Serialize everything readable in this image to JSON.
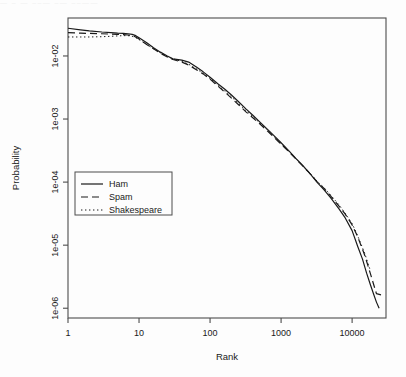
{
  "figure": {
    "background": "#fdfdfd",
    "ink": "#1a1a1a",
    "frame": "#4d4d4d",
    "artifact_text": "— –  — ––—  –— ––——"
  },
  "chart_data": {
    "type": "line",
    "title": "",
    "xlabel": "Rank",
    "ylabel": "Probability",
    "xscale": "log",
    "yscale": "log",
    "xlim": [
      1,
      30000
    ],
    "ylim": [
      7e-07,
      0.04
    ],
    "grid": false,
    "xticks": [
      1,
      10,
      100,
      1000,
      10000
    ],
    "xticklabels": [
      "1",
      "10",
      "100",
      "1000",
      "10000"
    ],
    "yticks": [
      0.01,
      0.001,
      0.0001,
      1e-05,
      1e-06
    ],
    "yticklabels": [
      "1e-02",
      "1e-03",
      "1e-04",
      "1e-05",
      "1e-06"
    ],
    "legend": {
      "position": "center-left",
      "entries": [
        {
          "name": "Ham",
          "dash": "solid"
        },
        {
          "name": "Spam",
          "dash": "dashed"
        },
        {
          "name": "Shakespeare",
          "dash": "dotted"
        }
      ]
    },
    "series": [
      {
        "name": "Ham",
        "dash": "solid",
        "x": [
          1,
          1.5,
          2,
          3,
          4,
          5,
          6,
          7,
          8,
          9,
          10,
          13,
          16,
          20,
          25,
          30,
          40,
          50,
          65,
          80,
          100,
          130,
          160,
          200,
          250,
          320,
          400,
          500,
          650,
          800,
          1000,
          1300,
          1600,
          2000,
          2500,
          3200,
          4000,
          5000,
          6500,
          8000,
          10000,
          12000,
          14000,
          16000,
          18000,
          20000,
          22000,
          24000
        ],
        "y": [
          0.0275,
          0.026,
          0.025,
          0.024,
          0.0235,
          0.023,
          0.0228,
          0.0225,
          0.022,
          0.021,
          0.0195,
          0.016,
          0.0135,
          0.0115,
          0.01,
          0.009,
          0.0086,
          0.008,
          0.0066,
          0.0056,
          0.0046,
          0.0036,
          0.003,
          0.0024,
          0.0019,
          0.00145,
          0.00115,
          0.0009,
          0.00068,
          0.00054,
          0.00042,
          0.00031,
          0.00024,
          0.000185,
          0.00014,
          0.0001,
          7.6e-05,
          5.6e-05,
          3.8e-05,
          2.7e-05,
          1.7e-05,
          9.5e-06,
          6e-06,
          3.6e-06,
          2.4e-06,
          1.7e-06,
          1.25e-06,
          1e-06
        ]
      },
      {
        "name": "Spam",
        "dash": "dashed",
        "x": [
          1,
          1.5,
          2,
          3,
          4,
          5,
          6,
          7,
          8,
          9,
          10,
          13,
          16,
          20,
          25,
          30,
          40,
          50,
          65,
          80,
          100,
          130,
          160,
          200,
          250,
          320,
          400,
          500,
          650,
          800,
          1000,
          1300,
          1600,
          2000,
          2500,
          3200,
          4000,
          5000,
          6500,
          8000,
          10000,
          12000,
          15000,
          18000,
          22000,
          27000
        ],
        "y": [
          0.0235,
          0.023,
          0.0228,
          0.0225,
          0.0222,
          0.022,
          0.0218,
          0.0215,
          0.021,
          0.02,
          0.0185,
          0.015,
          0.013,
          0.011,
          0.0096,
          0.0088,
          0.008,
          0.0072,
          0.006,
          0.0052,
          0.0043,
          0.0033,
          0.0027,
          0.00215,
          0.0017,
          0.0013,
          0.00105,
          0.00084,
          0.00064,
          0.00051,
          0.0004,
          0.0003,
          0.000235,
          0.000182,
          0.00014,
          0.000102,
          8e-05,
          6e-05,
          4.2e-05,
          3.1e-05,
          2.1e-05,
          1.35e-05,
          7e-06,
          3.6e-06,
          1.7e-06,
          1.6e-06
        ]
      },
      {
        "name": "Shakespeare",
        "dash": "dotted",
        "x": [
          1,
          1.5,
          2,
          3,
          4,
          5,
          6,
          7,
          8,
          9,
          10,
          13,
          16,
          20,
          25,
          30,
          40,
          50,
          65,
          80,
          100,
          130,
          160,
          200,
          250,
          320,
          400,
          500,
          650,
          800,
          1000,
          1300,
          1600,
          2000,
          2500,
          3200,
          4000,
          5000,
          6500,
          8000,
          10000,
          12000,
          15000,
          18000
        ],
        "y": [
          0.02,
          0.02,
          0.02,
          0.0202,
          0.0205,
          0.0208,
          0.021,
          0.021,
          0.0205,
          0.0195,
          0.0182,
          0.015,
          0.013,
          0.0112,
          0.0098,
          0.009,
          0.0082,
          0.0074,
          0.0062,
          0.0053,
          0.0044,
          0.0034,
          0.0028,
          0.00225,
          0.00178,
          0.00136,
          0.0011,
          0.00087,
          0.00066,
          0.000525,
          0.00041,
          0.000305,
          0.000238,
          0.000184,
          0.000142,
          0.000104,
          8.2e-05,
          6.2e-05,
          4.4e-05,
          3.2e-05,
          2.2e-05,
          1.4e-05,
          7.5e-06,
          4e-06
        ]
      }
    ]
  }
}
